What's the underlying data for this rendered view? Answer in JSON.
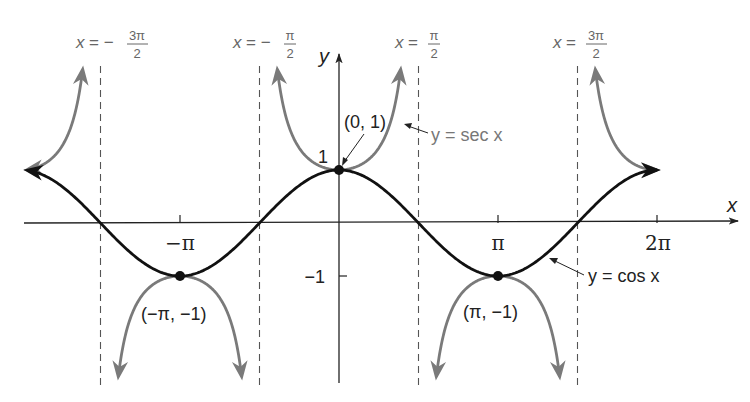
{
  "chart_data": {
    "type": "line",
    "title": "",
    "xlabel": "x",
    "ylabel": "y",
    "xlim": [
      -6.16,
      7.1
    ],
    "ylim": [
      -3.0,
      3.0
    ],
    "grid": false,
    "x_ticks": [
      {
        "value": -3.14159,
        "label": "−π"
      },
      {
        "value": 3.14159,
        "label": "π"
      },
      {
        "value": 6.28319,
        "label": "2π"
      }
    ],
    "y_ticks": [
      {
        "value": 1,
        "label": "1"
      },
      {
        "value": -1,
        "label": "−1"
      }
    ],
    "series": [
      {
        "name": "y = cos x",
        "function": "cos",
        "color": "#111111",
        "domain": [
          -6.16,
          6.28
        ]
      },
      {
        "name": "y = sec x",
        "function": "sec",
        "color": "#7a7a7a",
        "domain": [
          -6.16,
          6.28
        ]
      }
    ],
    "asymptotes": [
      {
        "value": -4.71239,
        "label_lhs": "x =",
        "label_sign": "−",
        "label_num": "3π",
        "label_den": "2"
      },
      {
        "value": -1.5708,
        "label_lhs": "x =",
        "label_sign": "−",
        "label_num": "π",
        "label_den": "2"
      },
      {
        "value": 1.5708,
        "label_lhs": "x =",
        "label_sign": "",
        "label_num": "π",
        "label_den": "2"
      },
      {
        "value": 4.71239,
        "label_lhs": "x =",
        "label_sign": "",
        "label_num": "3π",
        "label_den": "2"
      }
    ],
    "points": [
      {
        "x": 0,
        "y": 1,
        "label": "(0, 1)"
      },
      {
        "x": -3.14159,
        "y": -1,
        "label": "(−π, −1)"
      },
      {
        "x": 3.14159,
        "y": -1,
        "label": "(π, −1)"
      }
    ],
    "annotations": [
      {
        "text": "y = sec x",
        "target": "sec"
      },
      {
        "text": "y = cos x",
        "target": "cos"
      }
    ]
  },
  "labels": {
    "x_axis": "x",
    "y_axis": "y",
    "pt_top": "(0, 1)",
    "pt_left": "(−π, −1)",
    "pt_right": "(π, −1)",
    "sec_label": "y = sec x",
    "cos_label": "y = cos x",
    "tick_neg_pi": "−π",
    "tick_pi": "π",
    "tick_2pi": "2π",
    "tick_y1": "1",
    "tick_ym1": "−1"
  }
}
